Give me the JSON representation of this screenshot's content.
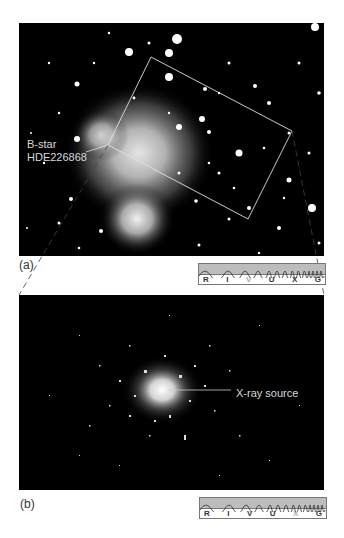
{
  "figure": {
    "panels": [
      {
        "id": "a",
        "label": "(a)",
        "description": "Optical star field image with rectangle marking zoom region",
        "annotation": {
          "line1": "B-star",
          "line2": "HDE226868"
        },
        "spectrum": {
          "bands": [
            "R",
            "I",
            "V",
            "U",
            "X",
            "G"
          ],
          "highlighted": "V"
        }
      },
      {
        "id": "b",
        "label": "(b)",
        "description": "X-ray image of the zoomed region",
        "annotation": {
          "text": "X-ray source"
        },
        "spectrum": {
          "bands": [
            "R",
            "I",
            "V",
            "U",
            "X",
            "G"
          ],
          "highlighted": "X"
        }
      }
    ],
    "colors": {
      "background": "#ffffff",
      "image_bg": "#000000",
      "annotation": "#d8d8d8",
      "spectrum_fill": "#bdbdbd"
    }
  }
}
